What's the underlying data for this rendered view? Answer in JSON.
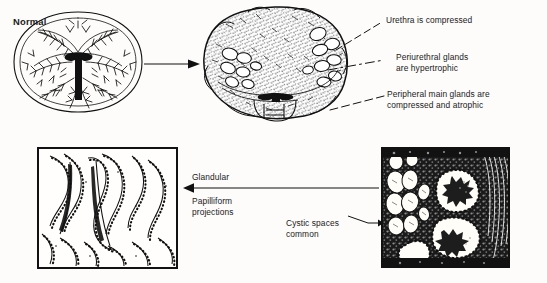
{
  "figure": {
    "title_text_present": false,
    "background_color": "#fdfcfa",
    "ink_color": "#111111"
  },
  "labels": {
    "normal": "Normal",
    "urethra_compressed": "Urethra is compressed",
    "periurethral_line1": "Periurethral glands",
    "periurethral_line2": "are hypertrophic",
    "peripheral_line1": "Peripheral main glands are",
    "peripheral_line2": "compressed and atrophic",
    "glandular": "Glandular",
    "papilliform_line1": "Papilliform",
    "papilliform_line2": "projections",
    "cystic_line1": "Cystic spaces",
    "cystic_line2": "common"
  },
  "panels": [
    {
      "name": "normal-prostate-cross-section",
      "caption": "Normal",
      "kind": "line-drawing"
    },
    {
      "name": "hyperplastic-prostate-cross-section",
      "caption": "",
      "kind": "stippled-drawing"
    },
    {
      "name": "glandular-papilliform-histology",
      "caption": "",
      "kind": "histology-panel"
    },
    {
      "name": "cystic-histology",
      "caption": "",
      "kind": "histology-panel"
    }
  ],
  "arrows": [
    {
      "name": "normal-to-hyperplastic",
      "direction": "right"
    },
    {
      "name": "cystic-to-glandular",
      "direction": "left"
    }
  ],
  "leader_lines": [
    {
      "name": "leader-urethra",
      "style": "dashed"
    },
    {
      "name": "leader-periurethral",
      "style": "dash-dot"
    },
    {
      "name": "leader-peripheral",
      "style": "dashed"
    },
    {
      "name": "leader-cystic",
      "style": "solid-arrow"
    }
  ]
}
